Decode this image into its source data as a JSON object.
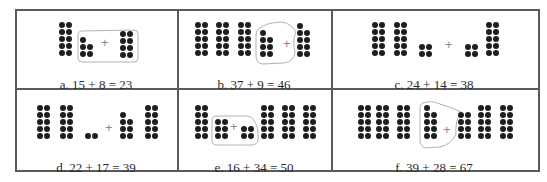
{
  "figure": {
    "colors": {
      "border": "#5a5a5a",
      "dot": "#1e1e1e",
      "loop": "#b0b0b0",
      "plus": "#8a8a8a",
      "text": "#2a2a2a"
    },
    "dot_size": 6,
    "dot_pitch": 7,
    "panels": [
      {
        "id": "a",
        "caption": "a. 15 + 8 = 23",
        "caption_pos": [
          96,
          77
        ],
        "plus_pos": [
          101,
          36
        ],
        "loop": "M82,31 Q78,31 78,36 L78,58 Q78,62 82,62 L134,62 Q138,62 138,58 L138,34 Q138,30 134,30 Z",
        "groups": [
          {
            "role": "tens",
            "x": 59,
            "y": 22,
            "cols": [
              5,
              5
            ]
          },
          {
            "role": "ones-left",
            "x": 80,
            "y": 37,
            "cols": [
              3,
              2
            ],
            "rows": 3
          },
          {
            "role": "ones-right",
            "x": 120,
            "y": 31,
            "cols": [
              4,
              4
            ],
            "rows": 4
          }
        ]
      },
      {
        "id": "b",
        "caption": "b. 37 + 9 = 46",
        "caption_pos": [
          254,
          77
        ],
        "plus_pos": [
          283,
          37
        ],
        "loop": "M258,29 Q268,22 282,22 Q292,24 296,32 Q292,40 295,52 Q294,62 284,63 L262,64 Q256,63 256,56 L256,36 Q256,31 258,29 Z",
        "groups": [
          {
            "role": "tens",
            "x": 195,
            "y": 22,
            "cols": [
              5,
              5
            ]
          },
          {
            "role": "tens",
            "x": 216,
            "y": 22,
            "cols": [
              5,
              5
            ]
          },
          {
            "role": "tens",
            "x": 238,
            "y": 22,
            "cols": [
              5,
              5
            ]
          },
          {
            "role": "ones-left",
            "x": 260,
            "y": 30,
            "cols": [
              4,
              3
            ],
            "rows": 4
          },
          {
            "role": "ones-right",
            "x": 297,
            "y": 23,
            "cols": [
              5,
              4
            ],
            "rows": 5
          }
        ]
      },
      {
        "id": "c",
        "caption": "c. 24 + 14 = 38",
        "caption_pos": [
          434,
          77
        ],
        "plus_pos": [
          445,
          38
        ],
        "loop": "",
        "groups": [
          {
            "role": "tens",
            "x": 372,
            "y": 22,
            "cols": [
              5,
              5
            ]
          },
          {
            "role": "tens",
            "x": 394,
            "y": 22,
            "cols": [
              5,
              5
            ]
          },
          {
            "role": "ones-left",
            "x": 419,
            "y": 44,
            "cols": [
              2,
              2
            ],
            "rows": 2
          },
          {
            "role": "ones-right",
            "x": 465,
            "y": 44,
            "cols": [
              2,
              2
            ],
            "rows": 2
          },
          {
            "role": "tens",
            "x": 486,
            "y": 22,
            "cols": [
              5,
              5
            ]
          }
        ]
      },
      {
        "id": "d",
        "caption": "d. 22 + 17 = 39",
        "caption_pos": [
          96,
          160
        ],
        "plus_pos": [
          105,
          121
        ],
        "loop": "",
        "groups": [
          {
            "role": "tens",
            "x": 37,
            "y": 105,
            "cols": [
              5,
              5
            ]
          },
          {
            "role": "tens",
            "x": 60,
            "y": 105,
            "cols": [
              5,
              5
            ]
          },
          {
            "role": "ones-left",
            "x": 85,
            "y": 133,
            "cols": [
              1,
              1
            ],
            "rows": 1
          },
          {
            "role": "ones-right",
            "x": 120,
            "y": 112,
            "cols": [
              4,
              3
            ],
            "rows": 4
          },
          {
            "role": "tens",
            "x": 145,
            "y": 105,
            "cols": [
              5,
              5
            ]
          }
        ]
      },
      {
        "id": "e",
        "caption": "e. 16 + 34 = 50",
        "caption_pos": [
          254,
          160
        ],
        "plus_pos": [
          230,
          120
        ],
        "loop": "M216,116 Q212,116 212,121 L212,140 Q212,145 217,145 L252,145 Q257,145 258,140 Q259,128 255,122 Q252,116 246,116 Z",
        "groups": [
          {
            "role": "tens",
            "x": 195,
            "y": 105,
            "cols": [
              5,
              5
            ]
          },
          {
            "role": "ones-left",
            "x": 215,
            "y": 119,
            "cols": [
              3,
              3
            ],
            "rows": 3
          },
          {
            "role": "ones-right",
            "x": 241,
            "y": 126,
            "cols": [
              2,
              2
            ],
            "rows": 2
          },
          {
            "role": "tens",
            "x": 261,
            "y": 105,
            "cols": [
              5,
              5
            ]
          },
          {
            "role": "tens",
            "x": 282,
            "y": 105,
            "cols": [
              5,
              5
            ]
          },
          {
            "role": "tens",
            "x": 303,
            "y": 105,
            "cols": [
              5,
              5
            ]
          }
        ]
      },
      {
        "id": "f",
        "caption": "f. 39 + 28 = 67",
        "caption_pos": [
          434,
          160
        ],
        "plus_pos": [
          443,
          123
        ],
        "loop": "M423,103 Q431,100 440,104 Q453,108 461,112 Q455,120 456,134 Q452,144 440,147 L425,148 Q420,146 420,140 L420,108 Q420,104 423,103 Z",
        "groups": [
          {
            "role": "tens",
            "x": 358,
            "y": 105,
            "cols": [
              5,
              5
            ]
          },
          {
            "role": "tens",
            "x": 376,
            "y": 105,
            "cols": [
              5,
              5
            ]
          },
          {
            "role": "tens",
            "x": 397,
            "y": 105,
            "cols": [
              5,
              5
            ]
          },
          {
            "role": "ones-left",
            "x": 424,
            "y": 105,
            "cols": [
              5,
              4
            ],
            "rows": 5
          },
          {
            "role": "ones-right",
            "x": 458,
            "y": 112,
            "cols": [
              4,
              4
            ],
            "rows": 4
          },
          {
            "role": "tens",
            "x": 478,
            "y": 105,
            "cols": [
              5,
              5
            ]
          },
          {
            "role": "tens",
            "x": 500,
            "y": 105,
            "cols": [
              5,
              5
            ]
          }
        ]
      }
    ]
  }
}
